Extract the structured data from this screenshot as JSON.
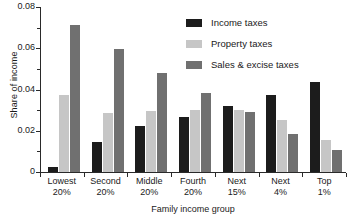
{
  "chart_data": {
    "type": "bar",
    "title": "",
    "xlabel": "Family income group",
    "ylabel": "Share of income",
    "categories": [
      "Lowest\n20%",
      "Second\n20%",
      "Middle\n20%",
      "Fourth\n20%",
      "Next\n15%",
      "Next\n4%",
      "Top\n1%"
    ],
    "category_lines": [
      [
        "Lowest",
        "20%"
      ],
      [
        "Second",
        "20%"
      ],
      [
        "Middle",
        "20%"
      ],
      [
        "Fourth",
        "20%"
      ],
      [
        "Next",
        "15%"
      ],
      [
        "Next",
        "4%"
      ],
      [
        "Top",
        "1%"
      ]
    ],
    "series": [
      {
        "name": "Income taxes",
        "color": "#1c1c1c",
        "values": [
          0.0023,
          0.0145,
          0.0225,
          0.0268,
          0.0322,
          0.0375,
          0.0435
        ]
      },
      {
        "name": "Property taxes",
        "color": "#c6c6c6",
        "values": [
          0.0375,
          0.0285,
          0.0298,
          0.03,
          0.0303,
          0.0252,
          0.0155
        ]
      },
      {
        "name": "Sales & excise taxes",
        "color": "#707070",
        "values": [
          0.0713,
          0.0598,
          0.0478,
          0.0385,
          0.0293,
          0.0185,
          0.0107
        ]
      }
    ],
    "ylim": [
      0,
      0.08
    ],
    "yticks": [
      0,
      0.02,
      0.04,
      0.06,
      0.08
    ],
    "ytick_labels": [
      "0",
      "0.02",
      "0.04",
      "0.06",
      "0.08"
    ],
    "yticks_minor": [
      0.01,
      0.03,
      0.05,
      0.07
    ],
    "grid": false,
    "legend_position": "top-right",
    "background": "#ffffff",
    "axis_color": "#2a2a2a"
  }
}
